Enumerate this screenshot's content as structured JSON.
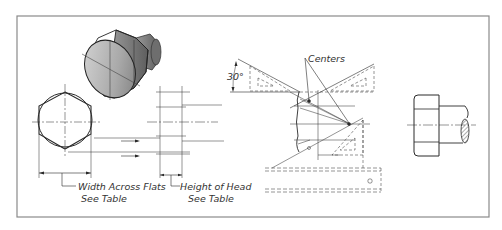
{
  "figure": {
    "labels": {
      "angle": "30°",
      "centers": "Centers",
      "width_across_flats": "Width Across Flats",
      "width_see_table": "See Table",
      "height_of_head": "Height of Head",
      "height_see_table": "See Table"
    },
    "colors": {
      "line": "#2a2a2a",
      "frame": "#8a8a8a",
      "shade_dark": "#6e6e6e",
      "shade_light": "#cfcfcf"
    }
  }
}
